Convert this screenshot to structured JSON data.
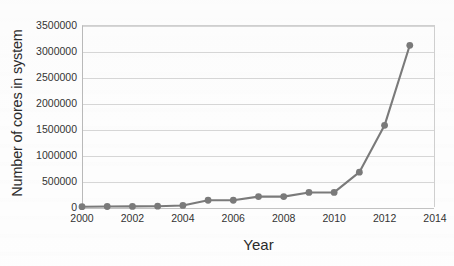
{
  "chart_data": {
    "type": "line",
    "title": "",
    "xlabel": "Year",
    "ylabel": "Number of cores in system",
    "x": [
      2000,
      2001,
      2002,
      2003,
      2004,
      2005,
      2006,
      2007,
      2008,
      2009,
      2010,
      2011,
      2012,
      2013
    ],
    "values": [
      6000,
      10000,
      12000,
      15000,
      30000,
      130000,
      130000,
      200000,
      200000,
      280000,
      280000,
      670000,
      1570000,
      3110000
    ],
    "series": [
      {
        "name": "Number of cores in system",
        "values": [
          6000,
          10000,
          12000,
          15000,
          30000,
          130000,
          130000,
          200000,
          200000,
          280000,
          280000,
          670000,
          1570000,
          3110000
        ]
      }
    ],
    "xlim": [
      2000,
      2014
    ],
    "ylim": [
      0,
      3500000
    ],
    "x_ticks": [
      2000,
      2002,
      2004,
      2006,
      2008,
      2010,
      2012,
      2014
    ],
    "x_tick_labels": [
      "2000",
      "2002",
      "2004",
      "2006",
      "2008",
      "2010",
      "2012",
      "2014"
    ],
    "y_ticks": [
      0,
      500000,
      1000000,
      1500000,
      2000000,
      2500000,
      3000000,
      3500000
    ],
    "y_tick_labels": [
      "0",
      "500000",
      "1000000",
      "1500000",
      "2000000",
      "2500000",
      "3000000",
      "3500000"
    ],
    "grid": true,
    "grid_axis": "y",
    "legend": false,
    "legend_position": "none",
    "marker": "circle",
    "colors": {
      "line": "#7a7a7a",
      "marker": "#7a7a7a",
      "gridline": "#d6d6d6",
      "axis": "#b9b9b9",
      "text": "#333333",
      "background": "#ffffff"
    }
  }
}
